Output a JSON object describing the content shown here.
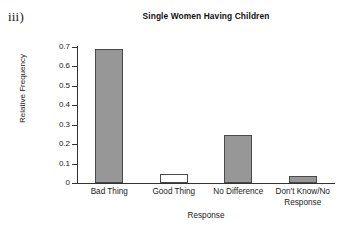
{
  "item_marker": "iii)",
  "chart_data": {
    "type": "bar",
    "title": "Single Women Having Children",
    "xlabel": "Response",
    "ylabel": "Relative Frequency",
    "categories": [
      "Bad Thing",
      "Good Thing",
      "No Difference",
      "Don't Know/No Response"
    ],
    "category_lines": [
      [
        "Bad Thing"
      ],
      [
        "Good Thing"
      ],
      [
        "No Difference"
      ],
      [
        "Don't Know/No",
        "Response"
      ]
    ],
    "values": [
      0.69,
      0.045,
      0.245,
      0.035
    ],
    "ylim": [
      0,
      0.7
    ],
    "ytick_values": [
      0,
      0.1,
      0.2,
      0.3,
      0.4,
      0.5,
      0.6,
      0.7
    ],
    "ytick_labels": [
      "0",
      "0.1",
      "0.2",
      "0.3",
      "0.4",
      "0.5",
      "0.6",
      "0.7"
    ],
    "grid": false,
    "legend": "none",
    "bar_colors": [
      "#979797",
      "#ffffff",
      "#979797",
      "#979797"
    ],
    "bar_edge_color": "#4a4a4a",
    "axis_color": "#333333",
    "background": "#ffffff"
  }
}
